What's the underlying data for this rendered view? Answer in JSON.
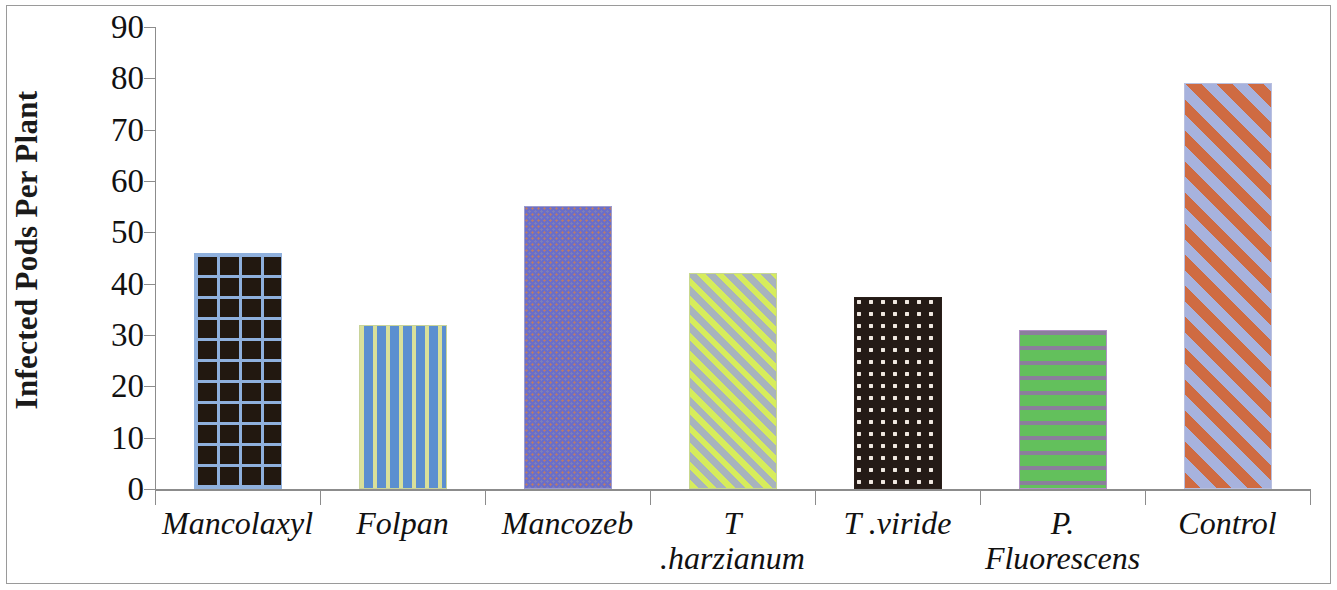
{
  "chart_data": {
    "type": "bar",
    "title": "",
    "subtitle": "",
    "xlabel": "",
    "ylabel": "Infected Pods Per Plant",
    "ylim": [
      0,
      90
    ],
    "ytick_step": 10,
    "grid": false,
    "legend": "none",
    "categories": [
      "Mancolaxyl",
      "Folpan",
      "Mancozeb",
      "T .harzianum",
      "T .viride",
      "P.\nFluorescens",
      "Control"
    ],
    "values": [
      46,
      32,
      55.2,
      42,
      37.5,
      31,
      79
    ],
    "ytick_labels": [
      "90",
      "80",
      "70",
      "60",
      "50",
      "40",
      "30",
      "20",
      "10",
      "0"
    ],
    "ytick_values": [
      90,
      80,
      70,
      60,
      50,
      40,
      30,
      20,
      10,
      0
    ],
    "series": [
      {
        "name": "Infected Pods Per Plant",
        "values": [
          46,
          32,
          55.2,
          42,
          37.5,
          31,
          79
        ]
      }
    ],
    "bar_styles": [
      {
        "category": "Mancolaxyl",
        "pattern": "grid-crosshatch",
        "fill": "#221810",
        "pattern_color": "#8fb0dd"
      },
      {
        "category": "Folpan",
        "pattern": "vertical-stripes",
        "fill": "#5b8fd0",
        "pattern_color": "#d8e09a"
      },
      {
        "category": "Mancozeb",
        "pattern": "fine-speckle",
        "fill": "#6b6ec8",
        "pattern_color": "#b07a74"
      },
      {
        "category": "T .harzianum",
        "pattern": "diagonal-stripes-up",
        "fill": "#a8b0b8",
        "pattern_color": "#d6ec5c"
      },
      {
        "category": "T .viride",
        "pattern": "polka-dots",
        "fill": "#241a16",
        "pattern_color": "#efe7e0"
      },
      {
        "category": "P. Fluorescens",
        "pattern": "horizontal-stripes",
        "fill": "#63c05c",
        "pattern_color": "#8b7f9c"
      },
      {
        "category": "Control",
        "pattern": "diagonal-stripes-up",
        "fill": "#a8b0dc",
        "pattern_color": "#cf6b42"
      }
    ],
    "axis_color": "#8c8c8c",
    "text_color": "#111111"
  }
}
